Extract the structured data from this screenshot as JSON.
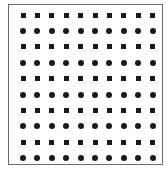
{
  "figure": {
    "rows": 10,
    "columns": 10,
    "row_shapes": [
      "square",
      "circle",
      "square",
      "circle",
      "square",
      "circle",
      "square",
      "circle",
      "square",
      "circle"
    ],
    "colors": {
      "mark": "#1a1a1a",
      "border": "#6a6a6a",
      "background": "#ffffff"
    }
  }
}
